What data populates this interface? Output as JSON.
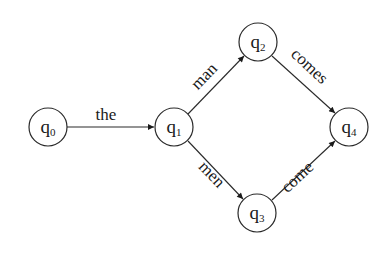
{
  "diagram": {
    "type": "finite-state-automaton",
    "nodes": [
      {
        "id": "q0",
        "base": "q",
        "sub": "0",
        "cx": 48,
        "cy": 127
      },
      {
        "id": "q1",
        "base": "q",
        "sub": "1",
        "cx": 174,
        "cy": 127
      },
      {
        "id": "q2",
        "base": "q",
        "sub": "2",
        "cx": 258,
        "cy": 42
      },
      {
        "id": "q3",
        "base": "q",
        "sub": "3",
        "cx": 257,
        "cy": 213
      },
      {
        "id": "q4",
        "base": "q",
        "sub": "4",
        "cx": 349,
        "cy": 127
      }
    ],
    "edges": [
      {
        "from": "q0",
        "to": "q1",
        "label": "the"
      },
      {
        "from": "q1",
        "to": "q2",
        "label": "man"
      },
      {
        "from": "q1",
        "to": "q3",
        "label": "men"
      },
      {
        "from": "q2",
        "to": "q4",
        "label": "comes"
      },
      {
        "from": "q3",
        "to": "q4",
        "label": "come"
      }
    ],
    "node_radius": 19,
    "colors": {
      "stroke": "#2a2a2a",
      "text": "#1a1a1a",
      "background": "#ffffff"
    }
  }
}
